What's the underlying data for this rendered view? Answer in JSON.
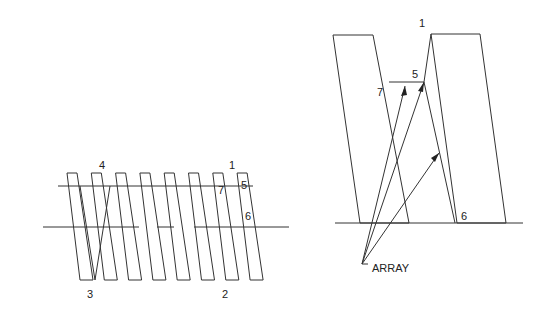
{
  "left_figure": {
    "labels": [
      {
        "text": "4",
        "x": 99,
        "y": 169
      },
      {
        "text": "1",
        "x": 229,
        "y": 169
      },
      {
        "text": "7",
        "x": 218,
        "y": 194
      },
      {
        "text": "5",
        "x": 241,
        "y": 189
      },
      {
        "text": "6",
        "x": 245,
        "y": 220
      },
      {
        "text": "3",
        "x": 87,
        "y": 298
      },
      {
        "text": "2",
        "x": 222,
        "y": 298
      }
    ]
  },
  "right_figure": {
    "labels": [
      {
        "text": "1",
        "x": 419,
        "y": 27
      },
      {
        "text": "5",
        "x": 412,
        "y": 78
      },
      {
        "text": "7",
        "x": 377,
        "y": 96
      },
      {
        "text": "6",
        "x": 461,
        "y": 220
      },
      {
        "text": "ARRAY",
        "x": 372,
        "y": 272
      }
    ]
  }
}
